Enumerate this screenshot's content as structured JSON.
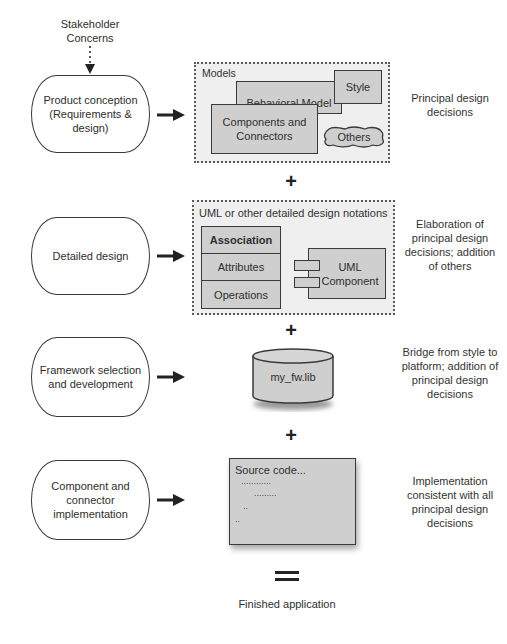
{
  "diagram": {
    "top_input": "Stakeholder Concerns",
    "stages": [
      {
        "label": "Product conception (Requirements & design)",
        "artifact_title": "Models",
        "note": "Principal design decisions"
      },
      {
        "label": "Detailed design",
        "artifact_title": "UML or other detailed design notations",
        "note": "Elaboration of principal design decisions; addition of others"
      },
      {
        "label": "Framework selection and development",
        "artifact_title": "my_fw.lib",
        "note": "Bridge from style to platform; addition of principal design decisions"
      },
      {
        "label": "Component and connector implementation",
        "artifact_title": "Source code...",
        "note": "Implementation consistent with all principal design decisions"
      }
    ],
    "models": {
      "style": "Style",
      "behavioral": "Behavioral Model",
      "components": "Components and Connectors",
      "others": "Others"
    },
    "uml": {
      "class_rows": [
        "Association",
        "Attributes",
        "Operations"
      ],
      "component": "UML Component"
    },
    "source_lines": [
      "............",
      ".........",
      "..",
      ".."
    ],
    "operators": {
      "plus": "+",
      "equals": "="
    },
    "result": "Finished application"
  }
}
